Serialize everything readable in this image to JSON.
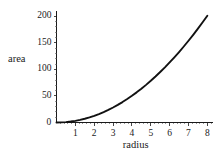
{
  "chart_data": {
    "type": "line",
    "title": "",
    "subtitle": "",
    "xlabel": "radius",
    "ylabel": "area",
    "xlim": [
      0,
      8.3
    ],
    "ylim": [
      0,
      210
    ],
    "grid": false,
    "legend": null,
    "x_ticks": [
      "1",
      "2",
      "3",
      "4",
      "5",
      "6",
      "7",
      "8"
    ],
    "x_tick_values": [
      1,
      2,
      3,
      4,
      5,
      6,
      7,
      8
    ],
    "y_ticks": [
      "50",
      "100",
      "150",
      "200"
    ],
    "y_tick_values": [
      50,
      100,
      150,
      200
    ],
    "origin_label": "0",
    "series": [
      {
        "name": "area = pi * radius^2",
        "color": "#111111",
        "x": [
          0,
          0.25,
          0.5,
          0.75,
          1,
          1.25,
          1.5,
          1.75,
          2,
          2.25,
          2.5,
          2.75,
          3,
          3.25,
          3.5,
          3.75,
          4,
          4.25,
          4.5,
          4.75,
          5,
          5.25,
          5.5,
          5.75,
          6,
          6.25,
          6.5,
          6.75,
          7,
          7.25,
          7.5,
          7.75,
          8
        ],
        "y": [
          0,
          0.2,
          0.79,
          1.77,
          3.14,
          4.91,
          7.07,
          9.62,
          12.57,
          15.9,
          19.63,
          23.76,
          28.27,
          33.18,
          38.48,
          44.18,
          50.27,
          56.75,
          63.62,
          70.88,
          78.54,
          86.59,
          95.03,
          103.87,
          113.1,
          122.72,
          132.73,
          143.14,
          153.94,
          165.13,
          176.71,
          188.69,
          201.06
        ]
      }
    ],
    "annotations": []
  }
}
